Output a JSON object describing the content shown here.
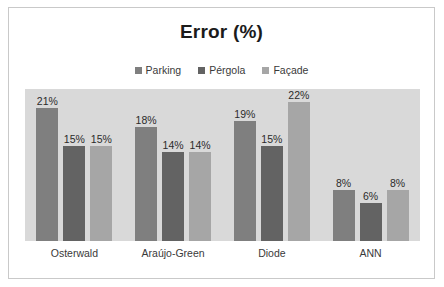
{
  "chart_data": {
    "type": "bar",
    "title": "Error (%)",
    "xlabel": "",
    "ylabel": "",
    "ylim": [
      0,
      24
    ],
    "grid": false,
    "legend_position": "top-center",
    "categories": [
      "Osterwald",
      "Araújo-Green",
      "Diode",
      "ANN"
    ],
    "series": [
      {
        "name": "Parking",
        "color": "#7f7f7f",
        "values": [
          21,
          18,
          19,
          8
        ],
        "labels": [
          "21%",
          "18%",
          "19%",
          "8%"
        ]
      },
      {
        "name": "Pérgola",
        "color": "#636363",
        "values": [
          15,
          14,
          15,
          6
        ],
        "labels": [
          "15%",
          "14%",
          "15%",
          "6%"
        ]
      },
      {
        "name": "Façade",
        "color": "#a6a6a6",
        "values": [
          15,
          14,
          22,
          8
        ],
        "labels": [
          "15%",
          "14%",
          "22%",
          "8%"
        ]
      }
    ],
    "plot_background": "#d9d9d9",
    "canvas_background": "#ffffff",
    "frame_color": "#c9c9c9"
  }
}
